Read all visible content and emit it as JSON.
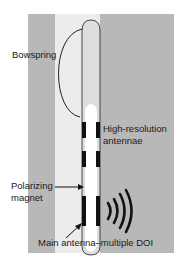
{
  "diagram": {
    "type": "catheter-illustration",
    "colors": {
      "background": "#ffffff",
      "tissue_gray": "#b8b8b8",
      "lumen_light": "#ececec",
      "probe_body": "#dedede",
      "probe_core": "#ffffff",
      "antenna_band": "#111111",
      "outline": "#333333"
    },
    "labels": {
      "bowspring": "Bowspring",
      "high_res_line1": "High-resolution",
      "high_res_line2": "antennae",
      "polarizing_line1": "Polarizing",
      "polarizing_line2": "magnet",
      "main_antenna": "Main antenna–multiple DOI"
    },
    "icons": {
      "signal_waves": "radio-waves-icon"
    }
  }
}
